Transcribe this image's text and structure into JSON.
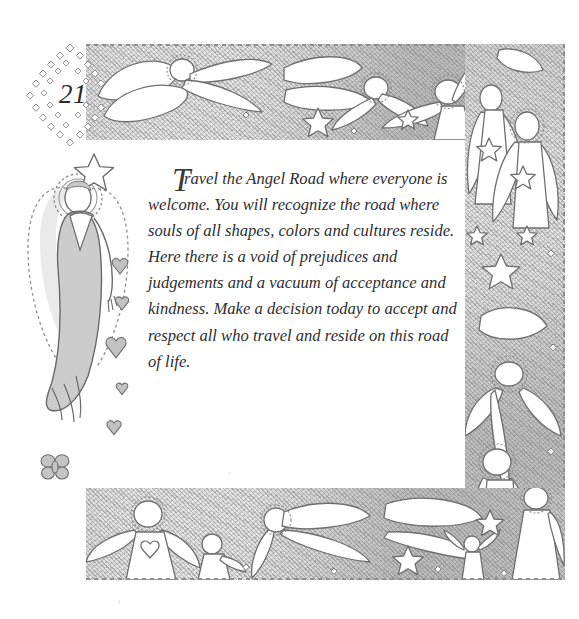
{
  "page": {
    "number": "21",
    "background_color": "#ffffff",
    "pencil_color": "#cfcfcf",
    "ink_color": "#2e2e2e"
  },
  "ornaments": {
    "page_number_frame": "diamond-lozenge-of-dots",
    "left_figure": "standing-angel-with-star-and-halo",
    "hearts_trail": "falling-hearts",
    "butterfly": "butterfly"
  },
  "borders": {
    "top": {
      "name": "top-border-flying-angels",
      "motifs": [
        "flying-angel",
        "flying-angel",
        "star",
        "flying-angel",
        "diamond",
        "flying-angel"
      ]
    },
    "right": {
      "name": "right-border-angels",
      "motifs": [
        "angel-with-star",
        "angel-with-halo",
        "star",
        "star",
        "flying-angel",
        "angel"
      ]
    },
    "bottom": {
      "name": "bottom-border-angel-procession",
      "motifs": [
        "angel-with-heart-dress",
        "child-angel",
        "flying-angel",
        "star-angel",
        "small-angel",
        "star",
        "standing-angel"
      ]
    }
  },
  "text": {
    "dropcap": "T",
    "body": "ravel the Angel Road where everyone is welcome. You will recognize the road where souls of all shapes, colors and cultures reside. Here there is a void of prejudices and judgements and a vacuum of acceptance and kindness. Make a decision today to accept and respect all who travel and reside on this road of life.",
    "full": "Travel the Angel Road where everyone is welcome. You will recognize the road where souls of all shapes, colors and cultures reside. Here there is a void of prejudices and judgements and a vacuum of acceptance and kindness. Make a decision today to accept and respect all who travel and reside on this road of life."
  }
}
